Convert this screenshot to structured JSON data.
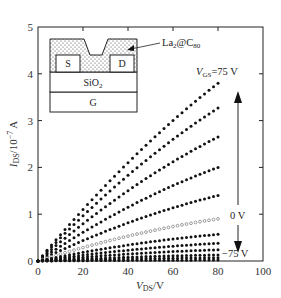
{
  "chart_data": {
    "type": "scatter",
    "title": "",
    "xlabel": "V_DS / V",
    "ylabel": "I_DS / 10^-7 A",
    "xlim": [
      0,
      100
    ],
    "ylim": [
      0,
      5
    ],
    "x_ticks": [
      "0",
      "20",
      "40",
      "60",
      "80",
      "100"
    ],
    "y_ticks": [
      "0",
      "1",
      "2",
      "3",
      "4",
      "5"
    ],
    "grid": false,
    "legend": "none",
    "x": "V_DS from 0 to 80 V in 2 V steps",
    "series": [
      {
        "name": "V_GS = 75 V",
        "marker": "filled",
        "end_value_at_80V": 3.8
      },
      {
        "name": "V_GS step",
        "marker": "filled",
        "end_value_at_80V": 3.27
      },
      {
        "name": "V_GS step",
        "marker": "filled",
        "end_value_at_80V": 2.65
      },
      {
        "name": "V_GS step",
        "marker": "filled",
        "end_value_at_80V": 2.0
      },
      {
        "name": "V_GS step",
        "marker": "filled",
        "end_value_at_80V": 1.4
      },
      {
        "name": "V_GS = 0 V",
        "marker": "open",
        "end_value_at_80V": 0.9
      },
      {
        "name": "V_GS step",
        "marker": "filled",
        "end_value_at_80V": 0.57
      },
      {
        "name": "V_GS step",
        "marker": "filled",
        "end_value_at_80V": 0.38
      },
      {
        "name": "V_GS step",
        "marker": "filled",
        "end_value_at_80V": 0.24
      },
      {
        "name": "V_GS step",
        "marker": "filled",
        "end_value_at_80V": 0.13
      },
      {
        "name": "V_GS step",
        "marker": "filled",
        "end_value_at_80V": 0.07
      },
      {
        "name": "V_GS = -75 V",
        "marker": "filled",
        "end_value_at_80V": 0.02
      }
    ],
    "annotations": [
      "V_GS=75 V",
      "0 V",
      "-75 V",
      "La2@C80"
    ],
    "inset": {
      "layers": [
        "La2@C80 film",
        "S",
        "D",
        "SiO2",
        "G"
      ]
    }
  },
  "labels": {
    "ylabel_main": "I",
    "ylabel_sub": "DS",
    "ylabel_rest": "/10",
    "ylabel_exp": "−7",
    "ylabel_unit": " A",
    "xlabel_main": "V",
    "xlabel_sub": "DS",
    "xlabel_rest": "/V",
    "vgs_top_main": "V",
    "vgs_top_sub": "GS",
    "vgs_top_rest": "=75 V",
    "zero_v": "0 V",
    "neg_v": "−75 V",
    "inset_s": "S",
    "inset_d": "D",
    "inset_sio2_main": "SiO",
    "inset_sio2_sub": "2",
    "inset_g": "G",
    "la_main": "La",
    "la_sub": "2",
    "la_at": "@C",
    "la_sub2": "80"
  }
}
